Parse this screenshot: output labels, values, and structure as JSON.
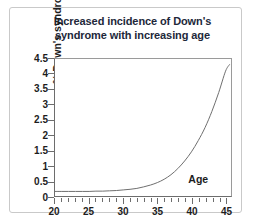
{
  "figure": {
    "title_line_1": "Increased incidence of Down's",
    "title_line_2": "syndrome with increasing age",
    "age_annotation": "Age",
    "colors": {
      "title_text": "#22283a",
      "axis_text": "#1d1d1d",
      "curve": "#6f6f6f",
      "axis_line": "#6d6d6d",
      "frame": "#c9c9c9",
      "background": "#ffffff"
    }
  },
  "chart_data": {
    "type": "line",
    "title": "Increased incidence of Down's syndrome with increasing age",
    "xlabel": "Age",
    "ylabel": "% Down's syndrome",
    "xlim": [
      20,
      45.8
    ],
    "ylim": [
      0,
      4.5
    ],
    "grid": false,
    "legend": null,
    "annotations": [
      {
        "text": "Age",
        "x": 41.5,
        "y": 0.55
      }
    ],
    "x_ticks_major": [
      20,
      25,
      30,
      35,
      40,
      45
    ],
    "x_tick_labels": [
      "20",
      "25",
      "30",
      "35",
      "40",
      "45"
    ],
    "x_ticks_minor_step": 1,
    "y_ticks": [
      0,
      0.5,
      1,
      1.5,
      2,
      2.5,
      3,
      3.5,
      4,
      4.5
    ],
    "y_tick_labels": [
      "0",
      "0.5",
      "1",
      "1.5",
      "2",
      "2.5",
      "3",
      "3.5",
      "4",
      "4.5"
    ],
    "series": [
      {
        "name": "% Down's syndrome",
        "x": [
          20,
          21,
          22,
          23,
          24,
          25,
          26,
          27,
          28,
          29,
          30,
          31,
          32,
          33,
          34,
          35,
          36,
          37,
          38,
          39,
          40,
          41,
          42,
          43,
          44,
          45,
          45.6
        ],
        "values": [
          0.15,
          0.15,
          0.15,
          0.15,
          0.15,
          0.15,
          0.16,
          0.16,
          0.17,
          0.18,
          0.2,
          0.22,
          0.25,
          0.3,
          0.36,
          0.44,
          0.55,
          0.7,
          0.9,
          1.15,
          1.45,
          1.82,
          2.25,
          2.78,
          3.4,
          4.1,
          4.32
        ]
      }
    ]
  }
}
